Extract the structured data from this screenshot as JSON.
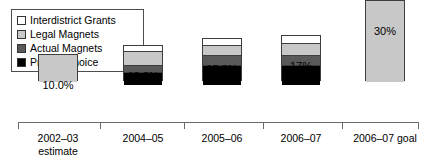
{
  "chart_data": {
    "type": "bar",
    "subtype": "stacked-bar",
    "title": "",
    "xlabel": "",
    "ylabel": "",
    "ylim": [
      0,
      32
    ],
    "grid": false,
    "legend_position": "top-left",
    "axis_color": "#6b6b6b",
    "categories": [
      "2002–03",
      "2004–05",
      "2005–06",
      "2006–07",
      "2006–07 goal"
    ],
    "category_sublabels": [
      "estimate",
      "",
      "",
      "",
      ""
    ],
    "data_labels": [
      "10.0%",
      "13.3%",
      "15.8%",
      "17%",
      "30%"
    ],
    "totals": [
      10.0,
      13.3,
      15.8,
      17.0,
      30.0
    ],
    "series": [
      {
        "name": "Interdistrict Grants",
        "color": "#ffffff",
        "values": [
          0,
          1.9,
          2.2,
          2.5,
          0
        ]
      },
      {
        "name": "Legal Magnets",
        "color": "#c8c8c8",
        "values": [
          10.0,
          4.6,
          3.3,
          4.0,
          30.0
        ]
      },
      {
        "name": "Actual Magnets",
        "color": "#595959",
        "values": [
          0,
          2.4,
          3.1,
          3.6,
          0
        ]
      },
      {
        "name": "Project Choice",
        "color": "#000000",
        "values": [
          0,
          4.4,
          7.2,
          6.9,
          0
        ]
      }
    ]
  },
  "legend": {
    "items": [
      {
        "label": "Interdistrict Grants",
        "color": "#ffffff"
      },
      {
        "label": "Legal Magnets",
        "color": "#c8c8c8"
      },
      {
        "label": "Actual Magnets",
        "color": "#595959"
      },
      {
        "label": "Project Choice",
        "color": "#000000"
      }
    ]
  }
}
